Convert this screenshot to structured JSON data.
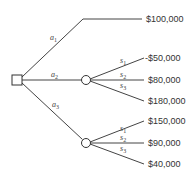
{
  "diagram": {
    "type": "decision-tree",
    "decision_node": {
      "shape": "square",
      "label": ""
    },
    "alternatives": [
      {
        "label": "a",
        "sub": "1",
        "payoff": "$100,000"
      },
      {
        "label": "a",
        "sub": "2",
        "chance_node": true,
        "states": [
          {
            "label": "s",
            "sub": "1",
            "payoff": "-$50,000"
          },
          {
            "label": "s",
            "sub": "2",
            "payoff": "$80,000"
          },
          {
            "label": "s",
            "sub": "3",
            "payoff": "$180,000"
          }
        ]
      },
      {
        "label": "a",
        "sub": "3",
        "chance_node": true,
        "states": [
          {
            "label": "s",
            "sub": "1",
            "payoff": "$150,000"
          },
          {
            "label": "s",
            "sub": "2",
            "payoff": "$90,000"
          },
          {
            "label": "s",
            "sub": "3",
            "payoff": "$40,000"
          }
        ]
      }
    ]
  }
}
